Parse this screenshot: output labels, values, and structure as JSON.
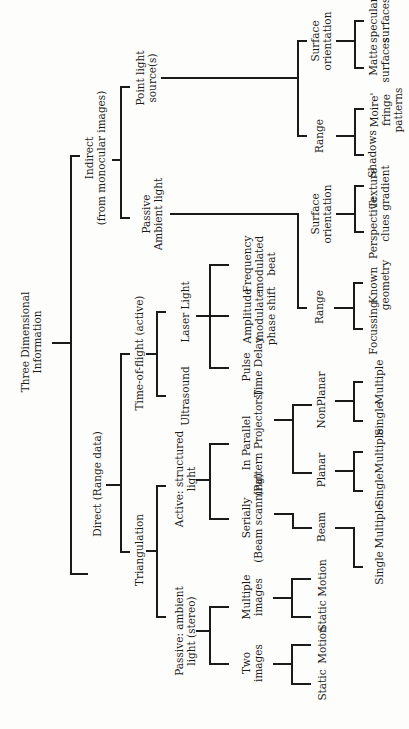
{
  "diagram": {
    "title": "Three Dimensional Information",
    "orientation": "rotated-90-ccw",
    "nodes": {
      "root": "Three Dimensional\nInformation",
      "indirect": "Indirect\n(from monocular images)",
      "point_light": "Point light\nsource(s)",
      "passive_ambient": "Passive\nAmbient light",
      "pl_surface_orientation": "Surface\norientation",
      "pl_range": "Range",
      "matte": "Matte\nsurfaces",
      "specular": "specular\nsurfaces",
      "shadows": "Shadows",
      "moire": "Moire'\nfringe\npatterns",
      "pa_surface_orientation": "Surface\norientation",
      "pa_range": "Range",
      "perspective": "Perspective\nclues",
      "texture": "Texture\ngradient",
      "focussing": "Focussing",
      "known_geometry": "Known\ngeometry",
      "direct": "Direct (Range data)",
      "time_of_flight": "Time-of-flight (active)",
      "laser_light": "Laser Light",
      "ultrasound": "Ultrasound",
      "pulse": "Pulse\nTime Delay",
      "amplitude": "Amplitude\nmodulate\nphase shift",
      "frequency": "Frequency\nmodulated\nbeat",
      "triangulation": "Triangulation",
      "active_structured": "Active: structured\nlight",
      "serially": "Serially\n(Beam scanning)",
      "in_parallel": "In Parallel\n(Pattern Projectors)",
      "beam": "Beam",
      "planar": "Planar",
      "nonplanar": "NonPlanar",
      "beam_single": "Single",
      "beam_multiple": "Multiple",
      "planar_single": "Single",
      "planar_multiple": "Multiple",
      "nonplanar_single": "Single",
      "nonplanar_multiple": "Multiple",
      "passive_ambient_stereo": "Passive: ambient\nlight (stereo)",
      "two_images": "Two\nimages",
      "multiple_images": "Multiple\nimages",
      "two_static": "Static",
      "two_motion": "Motion",
      "multi_static": "Static",
      "multi_motion": "Motion"
    }
  }
}
